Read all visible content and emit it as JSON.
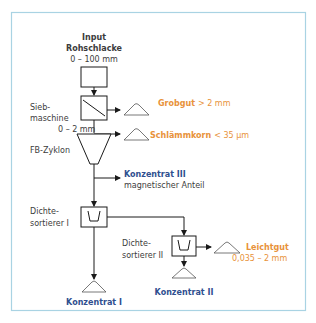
{
  "input": {
    "title": "Input",
    "material": "Rohschlacke",
    "range": "0 – 100 mm"
  },
  "siebmaschine": {
    "label_line1": "Sieb-",
    "label_line2": "maschine",
    "output_range": "0 – 2 mm",
    "reject_label": "Grobgut",
    "reject_value": "> 2 mm"
  },
  "zyklon": {
    "label": "FB-Zyklon",
    "reject_label": "Schlämmkorn",
    "reject_value": "< 35 µm"
  },
  "konzentrat3": {
    "title": "Konzentrat III",
    "subtitle": "magnetischer Anteil"
  },
  "dichtesortierer1": {
    "label_line1": "Dichte-",
    "label_line2": "sortierer I",
    "output": "Konzentrat I"
  },
  "dichtesortierer2": {
    "label_line1": "Dichte-",
    "label_line2": "sortierer II",
    "output": "Konzentrat II",
    "light_label": "Leichtgut",
    "light_value": "0,035 – 2 mm"
  },
  "colors": {
    "frame": "#a9d3e3",
    "accent_orange": "#e8923a",
    "accent_blue": "#2f4f8f",
    "line": "#1a1a1a"
  }
}
